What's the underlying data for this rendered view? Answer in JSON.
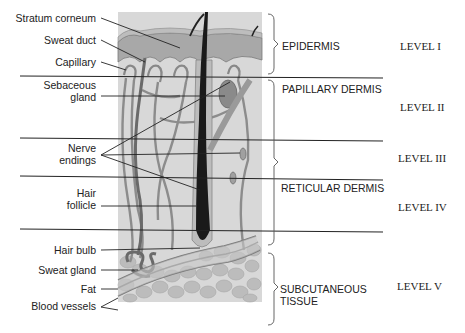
{
  "figure": {
    "left_labels": [
      {
        "id": "stratum-corneum",
        "text": "Stratum corneum"
      },
      {
        "id": "sweat-duct",
        "text": "Sweat duct"
      },
      {
        "id": "capillary",
        "text": "Capillary"
      },
      {
        "id": "sebaceous-gland",
        "lines": [
          "Sebaceous",
          "gland"
        ]
      },
      {
        "id": "nerve-endings",
        "lines": [
          "Nerve",
          "endings"
        ]
      },
      {
        "id": "hair-follicle",
        "lines": [
          "Hair",
          "follicle"
        ]
      },
      {
        "id": "hair-bulb",
        "text": "Hair bulb"
      },
      {
        "id": "sweat-gland",
        "text": "Sweat gland"
      },
      {
        "id": "fat",
        "text": "Fat"
      },
      {
        "id": "blood-vessels",
        "text": "Blood vessels"
      }
    ],
    "layers": [
      {
        "id": "epidermis",
        "lines": [
          "EPIDERMIS"
        ]
      },
      {
        "id": "papillary-dermis",
        "lines": [
          "PAPILLARY DERMIS"
        ]
      },
      {
        "id": "reticular-dermis",
        "lines": [
          "RETICULAR DERMIS"
        ]
      },
      {
        "id": "subcutaneous-tissue",
        "lines": [
          "SUBCUTANEOUS",
          "TISSUE"
        ]
      }
    ],
    "levels": [
      "LEVEL I",
      "LEVEL II",
      "LEVEL III",
      "LEVEL IV",
      "LEVEL V"
    ],
    "colors": {
      "background_tissue": "#d6d6d6",
      "epidermis": "#a9a9a9",
      "epidermis_top": "#bdbdbd",
      "vessel": "#8a8a8a",
      "hair": "#1a1a1a",
      "fat": "#b8b8b8",
      "line": "#222222"
    }
  }
}
